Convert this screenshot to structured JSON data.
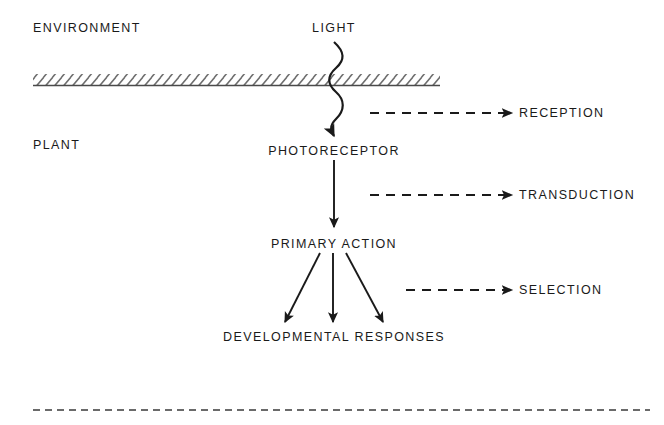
{
  "figure": {
    "type": "flow-diagram",
    "background_color": "#ffffff",
    "ink_color": "#1a1a1a",
    "regions": [
      {
        "id": "environment",
        "label": "ENVIRONMENT"
      },
      {
        "id": "plant",
        "label": "PLANT"
      }
    ],
    "nodes": [
      {
        "id": "light",
        "label": "LIGHT"
      },
      {
        "id": "photoreceptor",
        "label": "PHOTORECEPTOR"
      },
      {
        "id": "primary-action",
        "label": "PRIMARY ACTION"
      },
      {
        "id": "developmental-responses",
        "label": "DEVELOPMENTAL RESPONSES"
      }
    ],
    "stages": [
      {
        "id": "reception",
        "label": "RECEPTION"
      },
      {
        "id": "transduction",
        "label": "TRANSDUCTION"
      },
      {
        "id": "selection",
        "label": "SELECTION"
      }
    ],
    "boundary": {
      "id": "plant-surface-boundary",
      "style": "hatched"
    },
    "footer_rule": {
      "id": "footer-dashed-rule",
      "style": "dashed"
    }
  }
}
